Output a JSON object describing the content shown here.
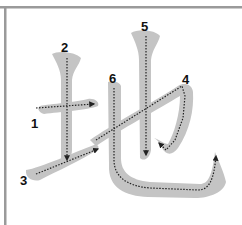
{
  "diagram": {
    "character": "地",
    "type": "stroke-order",
    "stroke_count": 6,
    "colors": {
      "frame": "#9a9a9a",
      "stroke_fill": "#c4c4c4",
      "guide_line": "#222222",
      "label": "#111111",
      "background": "#ffffff"
    },
    "strokes": [
      {
        "number": "1",
        "description": "horizontal"
      },
      {
        "number": "2",
        "description": "vertical"
      },
      {
        "number": "3",
        "description": "rising"
      },
      {
        "number": "4",
        "description": "horizontal-fold-hook"
      },
      {
        "number": "5",
        "description": "vertical"
      },
      {
        "number": "6",
        "description": "vertical-bend-hook"
      }
    ]
  }
}
